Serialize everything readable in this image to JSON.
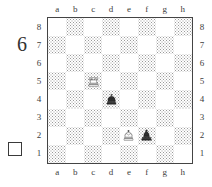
{
  "diagram": {
    "number": "6",
    "side_to_move_icon": "white-square",
    "side_to_move": "white"
  },
  "board": {
    "files": [
      "a",
      "b",
      "c",
      "d",
      "e",
      "f",
      "g",
      "h"
    ],
    "ranks": [
      "8",
      "7",
      "6",
      "5",
      "4",
      "3",
      "2",
      "1"
    ],
    "light_square_color": "#ffffff",
    "dark_square_color": "#9a9a9a",
    "border_color": "#444444",
    "pieces": [
      {
        "square": "c5",
        "file": "c",
        "rank": "5",
        "color": "white",
        "type": "rook",
        "glyph": "♖",
        "name": "white-rook"
      },
      {
        "square": "d4",
        "file": "d",
        "rank": "4",
        "color": "black",
        "type": "king",
        "glyph": "♚",
        "name": "black-king"
      },
      {
        "square": "e2",
        "file": "e",
        "rank": "2",
        "color": "white",
        "type": "king",
        "glyph": "♔",
        "name": "white-king"
      },
      {
        "square": "f2",
        "file": "f",
        "rank": "2",
        "color": "black",
        "type": "bishop",
        "glyph": "♝",
        "name": "black-bishop"
      }
    ]
  }
}
